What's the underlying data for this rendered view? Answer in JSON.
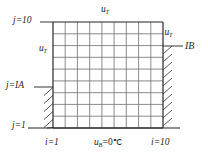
{
  "figure": {
    "type": "finite-difference-grid-diagram",
    "grid": {
      "columns": 9,
      "rows": 9,
      "nodes_x": 10,
      "nodes_y": 10,
      "i_min": 1,
      "i_max": 10,
      "j_min": 1,
      "j_max": 10
    },
    "colors": {
      "line": "#231f20",
      "grid_line": "#6d6e71",
      "background": "#ffffff",
      "text": "#231f20"
    },
    "labels": {
      "top_boundary": {
        "symbol": "u",
        "subscript": "T"
      },
      "left_boundary": {
        "symbol": "u",
        "subscript": "T"
      },
      "right_boundary": {
        "symbol": "u",
        "subscript": "T"
      },
      "bottom_boundary": {
        "symbol": "u",
        "subscript": "B",
        "equals": "=0",
        "unit": "℃"
      },
      "corner_top_left": "j=10",
      "corner_bottom_left": "j=1",
      "mid_left": "j=IA",
      "axis_left": "i=1",
      "axis_right": "i=10",
      "right_marker": "IB"
    }
  }
}
